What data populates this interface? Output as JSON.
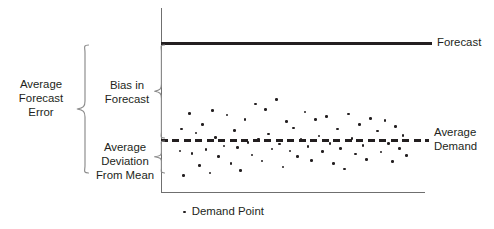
{
  "chart_data": {
    "type": "scatter",
    "title": "",
    "xlabel": "",
    "ylabel": "",
    "grid": false,
    "legend_position": "bottom",
    "axis": {
      "y_axis_top_px": 8,
      "y_axis_bottom_px": 193,
      "x_axis_left_px": 161,
      "x_axis_right_px": 425,
      "note": "unlabeled axes; values are relative magnitudes"
    },
    "reference_lines": [
      {
        "name": "forecast",
        "label": "Forecast",
        "style": "solid",
        "level": 0.805,
        "color": "#231f20"
      },
      {
        "name": "average-demand",
        "label": "Average Demand",
        "style": "dashed",
        "level": 0.285,
        "color": "#231f20"
      }
    ],
    "series": [
      {
        "name": "Demand Point",
        "marker": "dot",
        "color": "#231f20",
        "points": [
          [
            0.072,
            0.228
          ],
          [
            0.077,
            0.347
          ],
          [
            0.085,
            0.094
          ],
          [
            0.108,
            0.43
          ],
          [
            0.118,
            0.215
          ],
          [
            0.133,
            0.325
          ],
          [
            0.145,
            0.15
          ],
          [
            0.158,
            0.37
          ],
          [
            0.17,
            0.235
          ],
          [
            0.186,
            0.108
          ],
          [
            0.196,
            0.445
          ],
          [
            0.207,
            0.3
          ],
          [
            0.218,
            0.196
          ],
          [
            0.238,
            0.255
          ],
          [
            0.25,
            0.421
          ],
          [
            0.265,
            0.16
          ],
          [
            0.278,
            0.338
          ],
          [
            0.289,
            0.247
          ],
          [
            0.301,
            0.122
          ],
          [
            0.318,
            0.398
          ],
          [
            0.33,
            0.272
          ],
          [
            0.344,
            0.205
          ],
          [
            0.357,
            0.482
          ],
          [
            0.369,
            0.292
          ],
          [
            0.382,
            0.172
          ],
          [
            0.396,
            0.452
          ],
          [
            0.408,
            0.318
          ],
          [
            0.421,
            0.237
          ],
          [
            0.437,
            0.504
          ],
          [
            0.449,
            0.265
          ],
          [
            0.462,
            0.141
          ],
          [
            0.476,
            0.385
          ],
          [
            0.489,
            0.226
          ],
          [
            0.503,
            0.352
          ],
          [
            0.517,
            0.198
          ],
          [
            0.53,
            0.29
          ],
          [
            0.546,
            0.438
          ],
          [
            0.557,
            0.252
          ],
          [
            0.571,
            0.176
          ],
          [
            0.585,
            0.396
          ],
          [
            0.598,
            0.308
          ],
          [
            0.612,
            0.223
          ],
          [
            0.626,
            0.412
          ],
          [
            0.64,
            0.268
          ],
          [
            0.653,
            0.158
          ],
          [
            0.668,
            0.345
          ],
          [
            0.681,
            0.241
          ],
          [
            0.695,
            0.13
          ],
          [
            0.71,
            0.427
          ],
          [
            0.723,
            0.296
          ],
          [
            0.737,
            0.211
          ],
          [
            0.751,
            0.369
          ],
          [
            0.765,
            0.257
          ],
          [
            0.779,
            0.181
          ],
          [
            0.793,
            0.404
          ],
          [
            0.806,
            0.282
          ],
          [
            0.82,
            0.336
          ],
          [
            0.834,
            0.222
          ],
          [
            0.848,
            0.391
          ],
          [
            0.862,
            0.266
          ],
          [
            0.876,
            0.169
          ],
          [
            0.889,
            0.358
          ],
          [
            0.903,
            0.24
          ],
          [
            0.917,
            0.312
          ],
          [
            0.931,
            0.202
          ]
        ]
      }
    ],
    "annotations": [
      {
        "name": "average-forecast-error",
        "text": "Average\nForecast\nError",
        "lines": [
          "Average",
          "Forecast",
          "Error"
        ],
        "brace": "large-left",
        "spans": [
          "forecast",
          "lower-scatter-bound"
        ]
      },
      {
        "name": "bias-in-forecast",
        "text": "Bias in\nForecast",
        "lines": [
          "Bias in",
          "Forecast"
        ],
        "brace": "middle-upper",
        "spans": [
          "forecast",
          "average-demand"
        ]
      },
      {
        "name": "average-deviation-from-mean",
        "text": "Average\nDeviation\nFrom Mean",
        "lines": [
          "Average",
          "Deviation",
          "From Mean"
        ],
        "brace": "middle-lower",
        "spans": [
          "average-demand",
          "lower-scatter-bound"
        ]
      }
    ]
  },
  "labels": {
    "average_forecast_error": "Average\nForecast\nError",
    "bias_in_forecast": "Bias in\nForecast",
    "average_deviation_from_mean": "Average\nDeviation\nFrom Mean",
    "forecast": "Forecast",
    "average_demand": "Average\nDemand"
  },
  "legend": {
    "marker_icon": "dot-marker-icon",
    "text": "Demand Point"
  },
  "colors": {
    "ink": "#231f20",
    "axis": "#6f6f6f",
    "brace": "#8b8b8b",
    "background": "#ffffff"
  }
}
